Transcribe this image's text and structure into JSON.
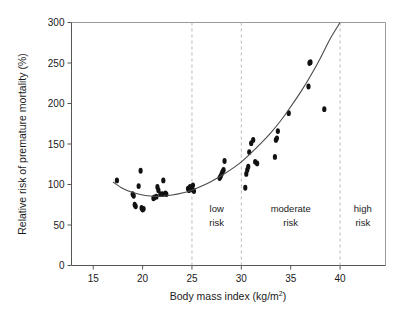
{
  "chart_data": {
    "type": "scatter",
    "title": "",
    "xlabel": "Body mass index (kg/m2)",
    "xlabel_base": "Body mass index (kg/m",
    "xlabel_sup": "2",
    "xlabel_tail": ")",
    "ylabel": "Relative risk of premature mortality (%)",
    "xlim": [
      12.8,
      44.6
    ],
    "ylim": [
      0,
      300
    ],
    "xticks": [
      15,
      20,
      25,
      30,
      35,
      40
    ],
    "xtick_labels": [
      "15",
      "20",
      "25",
      "30",
      "35",
      "40"
    ],
    "yticks": [
      0,
      50,
      100,
      150,
      200,
      250,
      300
    ],
    "ytick_labels": [
      "0",
      "50",
      "100",
      "150",
      "200",
      "250",
      "300"
    ],
    "grid": false,
    "legend": "none",
    "point_color": "#111111",
    "curve_color": "#4a4a4a",
    "divider_color": "#b9b9b9",
    "x": [
      17.4,
      19.0,
      19.1,
      19.2,
      19.3,
      19.6,
      19.8,
      19.9,
      20.0,
      20.1,
      21.1,
      21.2,
      21.4,
      21.5,
      21.6,
      21.8,
      22.0,
      22.1,
      22.3,
      22.4,
      24.6,
      24.7,
      24.8,
      24.9,
      25.0,
      25.1,
      25.2,
      27.8,
      27.9,
      28.0,
      28.1,
      28.2,
      28.3,
      30.4,
      30.5,
      30.6,
      30.7,
      30.8,
      31.0,
      31.2,
      31.4,
      31.6,
      33.4,
      33.5,
      33.6,
      33.7,
      34.8,
      36.8,
      36.9,
      37.0,
      38.4
    ],
    "y": [
      105,
      88,
      86,
      75,
      73,
      98,
      117,
      71,
      69,
      70,
      83,
      84,
      85,
      97,
      93,
      88,
      88,
      105,
      89,
      88,
      95,
      93,
      97,
      96,
      94,
      99,
      92,
      108,
      110,
      113,
      116,
      118,
      129,
      96,
      113,
      118,
      122,
      140,
      151,
      155,
      128,
      126,
      134,
      155,
      157,
      166,
      188,
      221,
      250,
      251,
      193
    ],
    "curve_points": [
      [
        17.0,
        103
      ],
      [
        18.0,
        95
      ],
      [
        19.0,
        90
      ],
      [
        20.0,
        87
      ],
      [
        21.0,
        85.5
      ],
      [
        22.0,
        85.5
      ],
      [
        23.0,
        87
      ],
      [
        24.0,
        89.5
      ],
      [
        25.0,
        93
      ],
      [
        26.0,
        98
      ],
      [
        27.0,
        104
      ],
      [
        28.0,
        111
      ],
      [
        29.0,
        119
      ],
      [
        30.0,
        128
      ],
      [
        31.0,
        139
      ],
      [
        32.0,
        151
      ],
      [
        33.0,
        164
      ],
      [
        34.0,
        179
      ],
      [
        35.0,
        196
      ],
      [
        36.0,
        214
      ],
      [
        37.0,
        234
      ],
      [
        38.0,
        256
      ],
      [
        39.0,
        280
      ],
      [
        40.0,
        300
      ]
    ],
    "zone_dividers": [
      25,
      30,
      40
    ],
    "zones": [
      {
        "label_line1": "low",
        "label_line2": "risk",
        "x_center": 27.5
      },
      {
        "label_line1": "moderate",
        "label_line2": "risk",
        "x_center": 35.0
      },
      {
        "label_line1": "high",
        "label_line2": "risk",
        "x_center": 42.3
      }
    ]
  }
}
